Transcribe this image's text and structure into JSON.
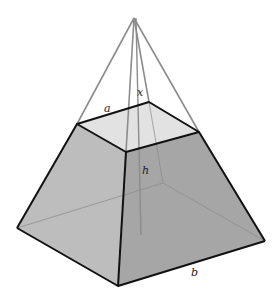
{
  "figure": {
    "labels": {
      "top_edge": "a",
      "slant_extension": "x",
      "height": "h",
      "bottom_edge": "b"
    },
    "colors": {
      "left_face": "#bdbdbd",
      "right_face": "#a6a6a6",
      "top_face": "#e2e2e2",
      "edge": "#111111",
      "hidden_edge": "#8a8a8a",
      "apex_lines": "#8c8c8c"
    }
  }
}
